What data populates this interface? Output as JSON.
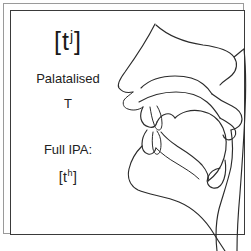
{
  "figure": {
    "name": "palatalised-t-articulation-diagram",
    "frame_border_color": "#3a3a3a",
    "outer_border_color": "#9a9a9a",
    "background_color": "#ffffff",
    "stroke_color": "#2b2b2b"
  },
  "labels": {
    "ipa_short_open_bracket": "[",
    "ipa_short_base": "t",
    "ipa_short_superscript": "j",
    "ipa_short_close_bracket": "]",
    "description_line_1": "Palatalised",
    "description_line_2": "T",
    "full_ipa_heading": "Full IPA:",
    "ipa_full_open_bracket": "[",
    "ipa_full_base": "t",
    "ipa_full_superscript": "h",
    "ipa_full_close_bracket": "]"
  },
  "diagram": {
    "parts": [
      "forehead-and-nose-profile",
      "nostril",
      "nasal-cavity",
      "hard-palate",
      "soft-palate-velum",
      "uvula",
      "upper-lip",
      "lower-lip",
      "tongue-tip-at-alveolar-ridge",
      "tongue-body-raised",
      "jaw-and-chin-profile",
      "pharyngeal-wall",
      "epiglottis",
      "neck-profile"
    ]
  }
}
